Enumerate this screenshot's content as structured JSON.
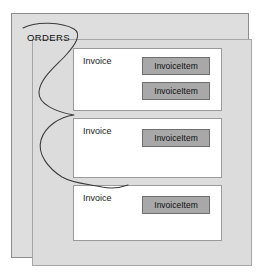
{
  "diagram": {
    "title_label": "ORDERS",
    "aggregate_boundary_name": "orders-aggregate-curve",
    "colors": {
      "outer_frame_fill": "#dedede",
      "inner_frame_fill": "#dcdcdc",
      "outer_frame_border": "#8d8d8d",
      "inner_frame_border": "#a6a6a6",
      "entity_fill": "#ffffff",
      "entity_border": "#9a9a9a",
      "item_fill": "#a8a8a8",
      "item_border": "#6e6e6e",
      "curve_stroke": "#3a3a3a",
      "text": "#111111"
    },
    "invoices": [
      {
        "label": "Invoice",
        "items": [
          {
            "label": "InvoiceItem"
          },
          {
            "label": "InvoiceItem"
          }
        ]
      },
      {
        "label": "Invoice",
        "items": [
          {
            "label": "InvoiceItem"
          }
        ]
      },
      {
        "label": "Invoice",
        "items": [
          {
            "label": "InvoiceItem"
          }
        ]
      }
    ]
  }
}
